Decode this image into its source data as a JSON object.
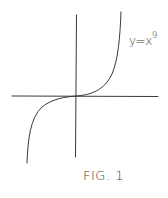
{
  "figure": {
    "equation": {
      "lhs": "y=x",
      "exponent": "9"
    },
    "caption": "FIG. 1",
    "ink_color": "#3a3a3a",
    "background": "#ffffff"
  },
  "axes": {
    "x_axis": {
      "y": 96,
      "x_start": 12,
      "x_end": 158
    },
    "y_axis": {
      "x": 76,
      "y_start": 15,
      "y_end": 157
    }
  },
  "curve": {
    "function": "y = x^9",
    "description": "hand-drawn sketch, flat near origin, steep at both ends"
  }
}
